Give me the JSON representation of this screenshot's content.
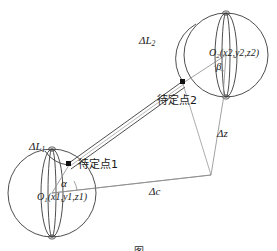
{
  "figure": {
    "type": "geometry-diagram",
    "caption": "图",
    "colors": {
      "stroke": "#3a3a3a",
      "thin_stroke": "#8a8a8a",
      "point_fill": "#111111",
      "background": "#ffffff"
    },
    "labels": {
      "delta_l2": {
        "symbol": "ΔL",
        "subscript": "2"
      },
      "delta_l1": {
        "symbol": "ΔL",
        "subscript": "1"
      },
      "delta_z": {
        "symbol": "Δz"
      },
      "delta_c": {
        "symbol": "Δc"
      },
      "alpha": {
        "symbol": "α"
      },
      "beta": {
        "symbol": "β"
      },
      "point_2": {
        "text": "待定点2"
      },
      "point_1": {
        "text": "待定点1"
      },
      "center_2": {
        "name": "O",
        "subscript": "2",
        "coords": "(x2,y2,z2)"
      },
      "center_1": {
        "name": "O",
        "subscript": "1",
        "coords": "(x1,y1,z1)"
      }
    },
    "geometry": {
      "sphere_1": {
        "cx": 52,
        "cy": 193,
        "r": 44
      },
      "sphere_2": {
        "cx": 226,
        "cy": 55,
        "r": 42
      },
      "point_1": {
        "x": 69,
        "y": 165
      },
      "point_2": {
        "x": 183,
        "y": 83
      },
      "corner": {
        "x": 211,
        "y": 175
      }
    }
  }
}
